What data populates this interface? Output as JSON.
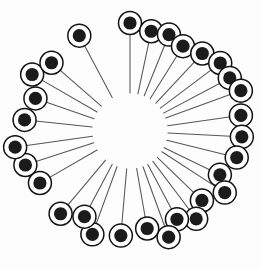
{
  "figure": {
    "kind": "radial-pin-diagram",
    "background_color": "#fdfdfd",
    "canvas": {
      "width": 261,
      "height": 269
    },
    "center": {
      "x": 130,
      "y": 131
    },
    "hub_radius": 37,
    "pin_count": 30,
    "colors": {
      "shaft": "#565656",
      "head_outline": "#111111",
      "head_fill": "#1b1b1b",
      "head_gap": "#ffffff",
      "background": "#fdfdfd"
    },
    "head_geometry": {
      "outer_radius": 11.5,
      "gap_radius": 9.5,
      "core_radius": 6.6,
      "outline_width": 1.5,
      "shaft_width": 1.05
    },
    "pins": [
      {
        "id": "pin-01",
        "angle_deg": -90.0,
        "head_distance": 108,
        "shaft_start": 38
      },
      {
        "id": "pin-02",
        "angle_deg": -78.0,
        "head_distance": 102,
        "shaft_start": 38
      },
      {
        "id": "pin-03",
        "angle_deg": -68.0,
        "head_distance": 104,
        "shaft_start": 38
      },
      {
        "id": "pin-04",
        "angle_deg": -58.0,
        "head_distance": 100,
        "shaft_start": 38
      },
      {
        "id": "pin-05",
        "angle_deg": -47.0,
        "head_distance": 106,
        "shaft_start": 38
      },
      {
        "id": "pin-06",
        "angle_deg": -37.0,
        "head_distance": 113,
        "shaft_start": 38
      },
      {
        "id": "pin-07",
        "angle_deg": -28.0,
        "head_distance": 113,
        "shaft_start": 38
      },
      {
        "id": "pin-08",
        "angle_deg": -20.0,
        "head_distance": 118,
        "shaft_start": 38
      },
      {
        "id": "pin-09",
        "angle_deg": -8.0,
        "head_distance": 112,
        "shaft_start": 38
      },
      {
        "id": "pin-10",
        "angle_deg": 3.0,
        "head_distance": 112,
        "shaft_start": 38
      },
      {
        "id": "pin-11",
        "angle_deg": 14.0,
        "head_distance": 110,
        "shaft_start": 38
      },
      {
        "id": "pin-12",
        "angle_deg": 26.0,
        "head_distance": 100,
        "shaft_start": 38
      },
      {
        "id": "pin-13",
        "angle_deg": 33.0,
        "head_distance": 113,
        "shaft_start": 38
      },
      {
        "id": "pin-14",
        "angle_deg": 44.0,
        "head_distance": 100,
        "shaft_start": 38
      },
      {
        "id": "pin-15",
        "angle_deg": 53.0,
        "head_distance": 110,
        "shaft_start": 38
      },
      {
        "id": "pin-16",
        "angle_deg": 62.0,
        "head_distance": 100,
        "shaft_start": 38
      },
      {
        "id": "pin-17",
        "angle_deg": 70.0,
        "head_distance": 113,
        "shaft_start": 38
      },
      {
        "id": "pin-18",
        "angle_deg": 80.0,
        "head_distance": 99,
        "shaft_start": 38
      },
      {
        "id": "pin-19",
        "angle_deg": 95.0,
        "head_distance": 105,
        "shaft_start": 38
      },
      {
        "id": "pin-20",
        "angle_deg": 110.0,
        "head_distance": 110,
        "shaft_start": 38
      },
      {
        "id": "pin-21",
        "angle_deg": 118.0,
        "head_distance": 97,
        "shaft_start": 38
      },
      {
        "id": "pin-22",
        "angle_deg": 130.0,
        "head_distance": 108,
        "shaft_start": 38
      },
      {
        "id": "pin-23",
        "angle_deg": 150.0,
        "head_distance": 104,
        "shaft_start": 38
      },
      {
        "id": "pin-24",
        "angle_deg": 162.0,
        "head_distance": 110,
        "shaft_start": 38
      },
      {
        "id": "pin-25",
        "angle_deg": 172.0,
        "head_distance": 116,
        "shaft_start": 38
      },
      {
        "id": "pin-26",
        "angle_deg": -174.0,
        "head_distance": 106,
        "shaft_start": 38
      },
      {
        "id": "pin-27",
        "angle_deg": -161.0,
        "head_distance": 100,
        "shaft_start": 38
      },
      {
        "id": "pin-28",
        "angle_deg": -150.0,
        "head_distance": 113,
        "shaft_start": 38
      },
      {
        "id": "pin-29",
        "angle_deg": -139.0,
        "head_distance": 104,
        "shaft_start": 38
      },
      {
        "id": "pin-30",
        "angle_deg": -118.0,
        "head_distance": 108,
        "shaft_start": 38
      }
    ]
  }
}
